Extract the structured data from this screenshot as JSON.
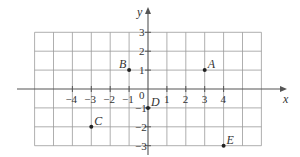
{
  "diagram": {
    "type": "coordinate-grid",
    "axes": {
      "x_label": "x",
      "y_label": "y",
      "origin_label": "0",
      "x_range": [
        -6,
        6
      ],
      "y_range": [
        -3,
        3
      ],
      "x_tick_labels": [
        "-4",
        "-3",
        "-2",
        "-1",
        "1",
        "2",
        "3",
        "4"
      ],
      "y_tick_labels": [
        "3",
        "2",
        "1",
        "-1",
        "-2",
        "-3"
      ]
    },
    "points": [
      {
        "label": "A",
        "x": 3,
        "y": 1
      },
      {
        "label": "B",
        "x": -1,
        "y": 1
      },
      {
        "label": "C",
        "x": -3,
        "y": -2
      },
      {
        "label": "D",
        "x": 0,
        "y": -1
      },
      {
        "label": "E",
        "x": 4,
        "y": -3
      }
    ],
    "colors": {
      "grid": "#9a9a9a",
      "axis": "#555555",
      "text": "#333333"
    }
  }
}
